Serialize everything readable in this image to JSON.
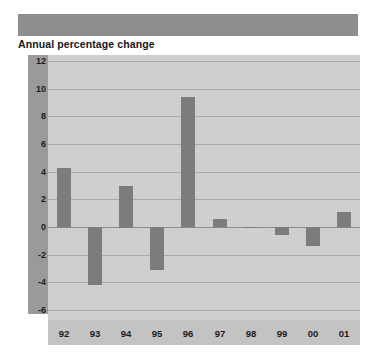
{
  "header": {
    "redacted_title": " "
  },
  "subtitle": "Annual percentage change",
  "chart_data": {
    "type": "bar",
    "title": "Annual percentage change",
    "xlabel": "",
    "ylabel": "",
    "categories": [
      "92",
      "93",
      "94",
      "95",
      "96",
      "97",
      "98",
      "99",
      "00",
      "01"
    ],
    "values": [
      4.3,
      -4.2,
      3.0,
      -3.1,
      9.4,
      0.55,
      0.0,
      -0.6,
      -1.4,
      1.05
    ],
    "ylim": [
      -6,
      12
    ],
    "ytick_labels": [
      "12",
      "10",
      "8",
      "6",
      "4",
      "2",
      "0",
      "-2",
      "-4",
      "-6"
    ],
    "ytick_values": [
      12,
      10,
      8,
      6,
      4,
      2,
      0,
      -2,
      -4,
      -6
    ],
    "grid": true,
    "legend": "none",
    "colors": {
      "bar": "#7c7c7c",
      "plot_background": "#cfcfcf",
      "axis_gutter": "#9a9a9a",
      "xaxis_band": "#c3c3c3",
      "gridline": "#a9a9a9",
      "zeroline": "#8c8c8c",
      "title_bar": "#8e8e8e",
      "text": "#1b1b1f"
    }
  }
}
